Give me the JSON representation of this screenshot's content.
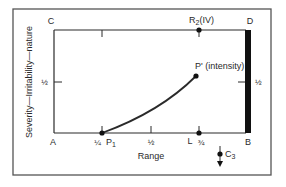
{
  "diagram": {
    "y_axis_label": "Severity—Irritability—nature",
    "x_axis_label": "Range",
    "corners": {
      "top_left": "C",
      "top_right": "D",
      "bottom_left": "A",
      "bottom_right": "B"
    },
    "x_ticks": {
      "quarter": "¼",
      "half": "½",
      "three_quarter": "¾"
    },
    "y_ticks": {
      "left_half": "½",
      "right_half": "½"
    },
    "points": {
      "p1": {
        "label": "P",
        "subscript": "1"
      },
      "p_prime": {
        "label": "P' (intensity)"
      },
      "l": {
        "label": "L"
      },
      "r2": {
        "label": "R",
        "subscript": "2",
        "suffix": "(IV)"
      },
      "c3": {
        "label": "C",
        "subscript": "3"
      }
    },
    "colors": {
      "line": "#2a2a2a",
      "frame": "#555555",
      "bar": "#111111"
    }
  }
}
